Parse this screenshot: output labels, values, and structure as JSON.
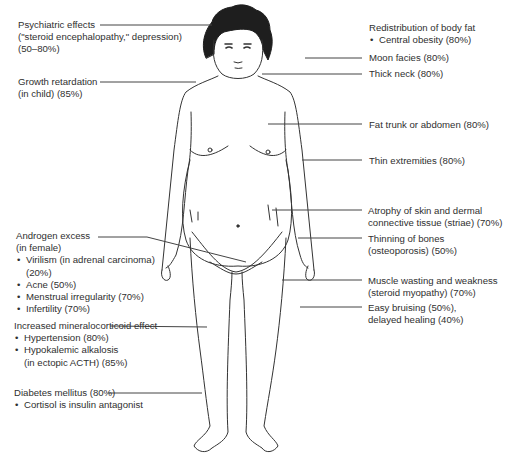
{
  "figure": {
    "line_color": "#333333"
  },
  "labels": {
    "psychiatric": {
      "line1": "Psychiatric effects",
      "line2": "(\"steroid encephalopathy,\" depression)",
      "line3": "(50–80%)"
    },
    "growth": {
      "line1": "Growth retardation",
      "line2": "(in child) (85%)"
    },
    "androgen": {
      "line1": "Androgen excess",
      "line2": "(in female)",
      "items": [
        "Virilism (in adrenal carcinoma)",
        "(20%)",
        "Acne (50%)",
        "Menstrual irregularity (70%)",
        "Infertility (70%)"
      ]
    },
    "mineralocorticoid": {
      "line1": "Increased mineralocorticoid effect",
      "items": [
        "Hypertension (80%)",
        "Hypokalemic alkalosis",
        "(in ectopic ACTH) (85%)"
      ]
    },
    "diabetes": {
      "line1": "Diabetes mellitus (80%)",
      "items": [
        "Cortisol is insulin antagonist"
      ]
    },
    "body_fat": {
      "line1": "Redistribution of body fat",
      "items": [
        "Central obesity (80%)"
      ]
    },
    "moon_facies": {
      "line1": "Moon facies (80%)"
    },
    "thick_neck": {
      "line1": "Thick neck (80%)"
    },
    "fat_trunk": {
      "line1": "Fat trunk or abdomen (80%)"
    },
    "thin_extremities": {
      "line1": "Thin extremities (80%)"
    },
    "skin_atrophy": {
      "line1": "Atrophy of skin and dermal",
      "line2": "connective tissue (striae) (70%)"
    },
    "bones": {
      "line1": "Thinning of bones",
      "line2": "(osteoporosis) (50%)"
    },
    "muscle": {
      "line1": "Muscle wasting and weakness",
      "line2": "(steroid myopathy) (70%)"
    },
    "bruising": {
      "line1": "Easy bruising (50%),",
      "line2": "delayed healing (40%)"
    }
  }
}
